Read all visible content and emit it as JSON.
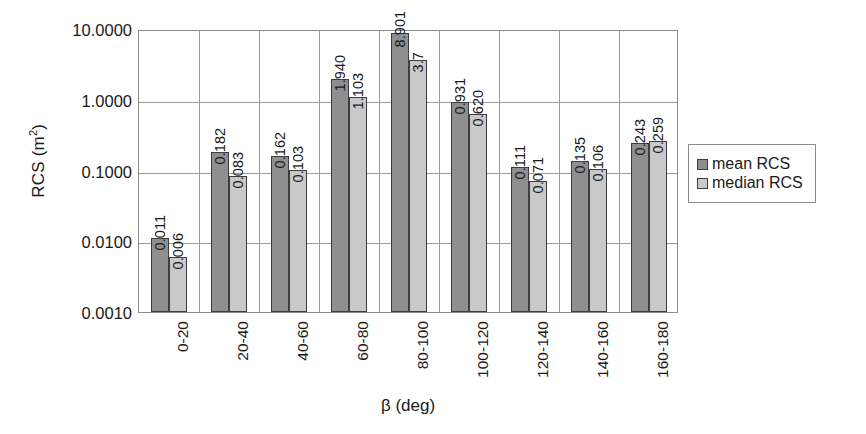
{
  "chart_data": {
    "type": "bar",
    "title": "",
    "xlabel": "β (deg)",
    "ylabel": "RCS (m²)",
    "ylabel_base": "RCS (m",
    "ylabel_sup": "2",
    "ylabel_close": ")",
    "yscale": "log",
    "ylim": [
      0.001,
      10.0
    ],
    "grid": true,
    "legend_position": "right",
    "ytick_labels": [
      "10.0000",
      "1.0000",
      "0.1000",
      "0.0100",
      "0.0010"
    ],
    "ytick_values": [
      10.0,
      1.0,
      0.1,
      0.01,
      0.001
    ],
    "categories": [
      "0-20",
      "20-40",
      "40-60",
      "60-80",
      "80-100",
      "100-120",
      "120-140",
      "140-160",
      "160-180"
    ],
    "series": [
      {
        "name": "mean RCS",
        "color": "#8f8f8f",
        "values": [
          0.011,
          0.182,
          0.162,
          1.94,
          8.901,
          0.931,
          0.111,
          0.135,
          0.243
        ],
        "labels": [
          "0.011",
          "0.182",
          "0.162",
          "1.940",
          "8.901",
          "0.931",
          "0.111",
          "0.135",
          "0.243"
        ]
      },
      {
        "name": "median RCS",
        "color": "#c9c9c9",
        "values": [
          0.006,
          0.083,
          0.103,
          1.103,
          3.7,
          0.62,
          0.071,
          0.106,
          0.259
        ],
        "labels": [
          "0.006",
          "0.083",
          "0.103",
          "1.103",
          "3.7",
          "0.620",
          "0.071",
          "0.106",
          "0.259"
        ]
      }
    ]
  },
  "legend": {
    "items": [
      {
        "label": "mean RCS",
        "swatch": "mean"
      },
      {
        "label": "median RCS",
        "swatch": "median"
      }
    ]
  }
}
